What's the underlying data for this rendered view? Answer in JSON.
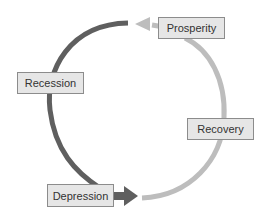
{
  "diagram": {
    "stages": [
      {
        "label": "Prosperity"
      },
      {
        "label": "Recession"
      },
      {
        "label": "Depression"
      },
      {
        "label": "Recovery"
      }
    ],
    "colors": {
      "downturn_arrow": "#5f5f5f",
      "upturn_arrow": "#bdbdbd",
      "box_fill": "#e6e6e6",
      "box_border": "#8c8c8c"
    }
  }
}
